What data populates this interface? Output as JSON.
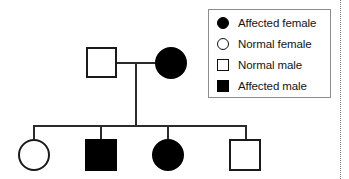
{
  "diagram": {
    "type": "pedigree-chart",
    "generations": [
      {
        "name": "parents",
        "individuals": [
          {
            "id": "father",
            "shape": "square",
            "fill": "open",
            "status": "normal",
            "sex": "male"
          },
          {
            "id": "mother",
            "shape": "circle",
            "fill": "filled",
            "status": "affected",
            "sex": "female"
          }
        ]
      },
      {
        "name": "children",
        "individuals": [
          {
            "id": "child-1",
            "shape": "circle",
            "fill": "open",
            "status": "normal",
            "sex": "female"
          },
          {
            "id": "child-2",
            "shape": "square",
            "fill": "filled",
            "status": "affected",
            "sex": "male"
          },
          {
            "id": "child-3",
            "shape": "circle",
            "fill": "filled",
            "status": "affected",
            "sex": "female"
          },
          {
            "id": "child-4",
            "shape": "square",
            "fill": "open",
            "status": "normal",
            "sex": "male"
          }
        ]
      }
    ]
  },
  "legend": {
    "items": [
      {
        "symbol": "filled-circle",
        "label": "Affected female"
      },
      {
        "symbol": "open-circle",
        "label": "Normal female"
      },
      {
        "symbol": "open-square",
        "label": "Normal male"
      },
      {
        "symbol": "filled-square",
        "label": "Affected male"
      }
    ]
  },
  "colors": {
    "symbol_fill": "#000000",
    "symbol_stroke": "#1a1a1a",
    "line": "#2b2b2b",
    "legend_border": "#8c8c8c",
    "background": "#ffffff",
    "text": "#141414"
  }
}
